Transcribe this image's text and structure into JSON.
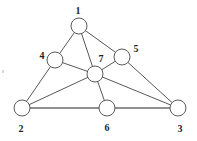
{
  "figure": {
    "background_color": "#ffffff",
    "edge_color": "#58585a",
    "baseline_edge_color": "#6d6d70",
    "node_fill": "#ffffff",
    "node_stroke": "#5a5a5c",
    "label_color": "#231f20",
    "node_radius": 8
  },
  "chart_data": {
    "type": "diagram",
    "graph_type": "undirected",
    "node_count": 7,
    "edge_count": 12,
    "nodes": [
      {
        "id": "1",
        "label": "1",
        "cx": 79,
        "cy": 26,
        "r": 8,
        "label_x": 78,
        "label_y": 11
      },
      {
        "id": "2",
        "label": "2",
        "cx": 22,
        "cy": 108,
        "r": 8,
        "label_x": 21,
        "label_y": 129
      },
      {
        "id": "3",
        "label": "3",
        "cx": 178,
        "cy": 108,
        "r": 8,
        "label_x": 180,
        "label_y": 129
      },
      {
        "id": "4",
        "label": "4",
        "cx": 55,
        "cy": 60,
        "r": 8,
        "label_x": 42,
        "label_y": 56
      },
      {
        "id": "5",
        "label": "5",
        "cx": 122,
        "cy": 57,
        "r": 8,
        "label_x": 136,
        "label_y": 49
      },
      {
        "id": "6",
        "label": "6",
        "cx": 107,
        "cy": 108,
        "r": 8,
        "label_x": 107,
        "label_y": 128
      },
      {
        "id": "7",
        "label": "7",
        "cx": 95,
        "cy": 74,
        "r": 8,
        "label_x": 101,
        "label_y": 59
      }
    ],
    "edges": [
      {
        "from": "1",
        "to": "4",
        "x1": 79,
        "y1": 26,
        "x2": 55,
        "y2": 60,
        "weight": "normal"
      },
      {
        "from": "1",
        "to": "7",
        "x1": 79,
        "y1": 26,
        "x2": 95,
        "y2": 74,
        "weight": "normal"
      },
      {
        "from": "1",
        "to": "5",
        "x1": 79,
        "y1": 26,
        "x2": 122,
        "y2": 57,
        "weight": "normal"
      },
      {
        "from": "4",
        "to": "7",
        "x1": 55,
        "y1": 60,
        "x2": 95,
        "y2": 74,
        "weight": "normal"
      },
      {
        "from": "4",
        "to": "2",
        "x1": 55,
        "y1": 60,
        "x2": 22,
        "y2": 108,
        "weight": "normal"
      },
      {
        "from": "5",
        "to": "7",
        "x1": 122,
        "y1": 57,
        "x2": 95,
        "y2": 74,
        "weight": "normal"
      },
      {
        "from": "5",
        "to": "3",
        "x1": 122,
        "y1": 57,
        "x2": 178,
        "y2": 108,
        "weight": "normal"
      },
      {
        "from": "7",
        "to": "2",
        "x1": 95,
        "y1": 74,
        "x2": 22,
        "y2": 108,
        "weight": "normal"
      },
      {
        "from": "7",
        "to": "6",
        "x1": 95,
        "y1": 74,
        "x2": 107,
        "y2": 108,
        "weight": "normal"
      },
      {
        "from": "7",
        "to": "3",
        "x1": 95,
        "y1": 74,
        "x2": 178,
        "y2": 108,
        "weight": "normal"
      },
      {
        "from": "2",
        "to": "6",
        "x1": 22,
        "y1": 108,
        "x2": 107,
        "y2": 108,
        "weight": "thick"
      },
      {
        "from": "6",
        "to": "3",
        "x1": 107,
        "y1": 108,
        "x2": 178,
        "y2": 108,
        "weight": "thick"
      }
    ],
    "adjacency": {
      "1": [
        "4",
        "5",
        "7"
      ],
      "2": [
        "4",
        "6",
        "7"
      ],
      "3": [
        "5",
        "6",
        "7"
      ],
      "4": [
        "1",
        "2",
        "7"
      ],
      "5": [
        "1",
        "3",
        "7"
      ],
      "6": [
        "2",
        "3",
        "7"
      ],
      "7": [
        "1",
        "2",
        "3",
        "4",
        "5",
        "6"
      ]
    },
    "title": "",
    "xlabel": "",
    "ylabel": "",
    "legend": []
  },
  "artifacts": [
    {
      "name": "edge-speck",
      "x": 2,
      "y": 70
    }
  ]
}
